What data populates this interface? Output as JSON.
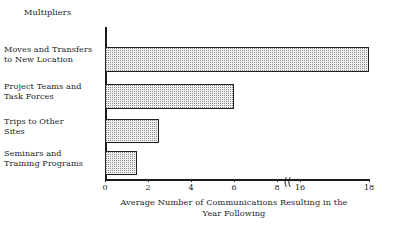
{
  "group_title": "Multipliers",
  "chart_data": {
    "type": "bar",
    "orientation": "horizontal",
    "title": "",
    "subtitle": "",
    "xlabel_lines": [
      "Average Number of Communications Resulting in the",
      "Year Following"
    ],
    "xlabel": "Average Number of Communications Resulting in the Year Following",
    "ylabel": "",
    "group_label": "Multipliers",
    "categories": [
      "Moves and Transfers to New Location",
      "Project Teams and Task Forces",
      "Trips to Other Sites",
      "Seminars and Training Programs"
    ],
    "category_lines": [
      [
        "Moves and Transfers",
        "to New Location"
      ],
      [
        "Project Teams and",
        "Task Forces"
      ],
      [
        "Trips to Other",
        "Sites"
      ],
      [
        "Seminars and",
        "Training Programs"
      ]
    ],
    "values": [
      18,
      6,
      2.5,
      1.5
    ],
    "tick_labels": [
      "0",
      "2",
      "4",
      "6",
      "8",
      "16",
      "18"
    ],
    "tick_values": [
      0,
      2,
      4,
      6,
      8,
      16,
      18
    ],
    "xlim": [
      0,
      18
    ],
    "axis_break": true,
    "axis_break_between": [
      8,
      16
    ],
    "grid": false,
    "legend": false,
    "bar_fill_color": "#efefef",
    "bar_pattern": "fine-dotted-stipple",
    "bar_edge_color": "#221f1d",
    "axis_color": "#1d1a18",
    "text_color": "#201d1b",
    "background_color": "#ffffff"
  },
  "icons": {
    "axis_break": "axis-break-glyph"
  }
}
